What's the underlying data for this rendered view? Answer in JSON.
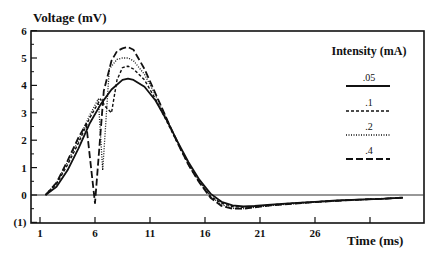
{
  "chart_data": {
    "type": "line",
    "title": "",
    "ylabel": "Voltage (mV)",
    "xlabel": "Time (ms)",
    "ylim": [
      -1,
      6
    ],
    "xlim": [
      0.2,
      35
    ],
    "yticks": [
      6,
      5,
      4,
      3,
      2,
      1,
      0,
      -1
    ],
    "ytick_labels": [
      "6",
      "5",
      "4",
      "3",
      "2",
      "1",
      "0",
      "(1)"
    ],
    "xticks": [
      1,
      6,
      11,
      16,
      21,
      26,
      31
    ],
    "xtick_labels": [
      "1",
      "6",
      "11",
      "16",
      "21",
      "26",
      ""
    ],
    "grid": false,
    "zero_line": true,
    "legend_title": "Intensity (mA)",
    "legend_position": "upper right",
    "series": [
      {
        "name": ".05",
        "style": "solid",
        "x": [
          1.5,
          2.5,
          3.5,
          4.5,
          5.5,
          6.5,
          7.5,
          8.5,
          9,
          9.5,
          10.5,
          11.5,
          12.5,
          13.5,
          14.5,
          15.5,
          16.5,
          17.5,
          18.5,
          19.5,
          20.5,
          22,
          24,
          26,
          28,
          30,
          32,
          34
        ],
        "y": [
          0,
          0.3,
          0.9,
          1.7,
          2.6,
          3.3,
          3.85,
          4.2,
          4.25,
          4.2,
          3.95,
          3.45,
          2.75,
          1.95,
          1.2,
          0.55,
          0.05,
          -0.25,
          -0.38,
          -0.42,
          -0.4,
          -0.35,
          -0.3,
          -0.25,
          -0.2,
          -0.17,
          -0.14,
          -0.1
        ]
      },
      {
        "name": ".1",
        "style": "short-dash",
        "x": [
          1.5,
          2.5,
          3.5,
          4.5,
          5.5,
          6.5,
          7,
          7.5,
          8,
          8.5,
          9,
          9.5,
          10.5,
          11.5,
          12.5,
          13.5,
          14.5,
          15.5,
          16.5,
          17.5,
          18.5,
          19.5,
          20.5,
          22,
          24,
          26,
          28,
          30,
          32,
          34
        ],
        "y": [
          0,
          0.4,
          1.1,
          1.9,
          2.8,
          3.5,
          3.2,
          3.0,
          4.2,
          4.65,
          4.7,
          4.6,
          4.2,
          3.5,
          2.7,
          1.9,
          1.1,
          0.45,
          -0.05,
          -0.3,
          -0.42,
          -0.45,
          -0.42,
          -0.36,
          -0.3,
          -0.25,
          -0.2,
          -0.17,
          -0.14,
          -0.1
        ]
      },
      {
        "name": ".2",
        "style": "dotted",
        "x": [
          1.5,
          2.5,
          3.5,
          4.5,
          5.5,
          6.3,
          6.7,
          7.3,
          8,
          8.5,
          9,
          9.5,
          10.5,
          11.5,
          12.5,
          13.5,
          14.5,
          15.5,
          16.5,
          17.5,
          18.5,
          19.5,
          20.5,
          22,
          24,
          26,
          28,
          30,
          32,
          34
        ],
        "y": [
          0,
          0.45,
          1.2,
          2.0,
          2.9,
          3.5,
          0.9,
          4.6,
          4.95,
          5.0,
          5.0,
          4.9,
          4.4,
          3.65,
          2.8,
          1.95,
          1.15,
          0.5,
          -0.05,
          -0.35,
          -0.48,
          -0.5,
          -0.45,
          -0.38,
          -0.32,
          -0.26,
          -0.21,
          -0.17,
          -0.14,
          -0.1
        ]
      },
      {
        "name": ".4",
        "style": "long-dash",
        "x": [
          1.5,
          2.5,
          3.5,
          4.5,
          5.2,
          6,
          6.8,
          7.5,
          8,
          8.5,
          9,
          9.5,
          10.5,
          11.5,
          12.5,
          13.5,
          14.5,
          15.5,
          16.5,
          17.5,
          18.5,
          19.5,
          20.5,
          22,
          24,
          26,
          28,
          30,
          32,
          34
        ],
        "y": [
          0,
          0.45,
          1.25,
          2.1,
          2.6,
          -0.3,
          3.8,
          4.9,
          5.25,
          5.35,
          5.4,
          5.3,
          4.6,
          3.7,
          2.8,
          1.9,
          1.1,
          0.45,
          -0.1,
          -0.4,
          -0.5,
          -0.5,
          -0.45,
          -0.38,
          -0.32,
          -0.26,
          -0.21,
          -0.17,
          -0.14,
          -0.1
        ]
      }
    ]
  },
  "labels": {
    "ylabel": "Voltage (mV)",
    "xlabel": "Time (ms)",
    "legend_title": "Intensity (mA)"
  }
}
